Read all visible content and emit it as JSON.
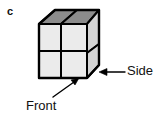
{
  "figure": {
    "panel_letter": "c",
    "labels": {
      "front": "Front",
      "side": "Side"
    },
    "annotations": [
      {
        "name": "front-arrow",
        "label": "Front",
        "points_to": "front-face",
        "direction": "up-right diagonal"
      },
      {
        "name": "side-arrow",
        "label": "Side",
        "points_to": "right-side-face",
        "direction": "leftward horizontal"
      }
    ],
    "cube": {
      "rows": 2,
      "columns": 2,
      "depth": 1,
      "front_face_cells": 4,
      "top_face_cells": 2,
      "side_face_cells": 2,
      "total_visible_faces": 3
    },
    "colors": {
      "front_face_fill": "#ebebeb",
      "top_face_fill": "#8c8c8c",
      "side_face_fill": "#d4d4d4",
      "outline": "#000000",
      "background": "#ffffff",
      "text": "#111111"
    }
  }
}
